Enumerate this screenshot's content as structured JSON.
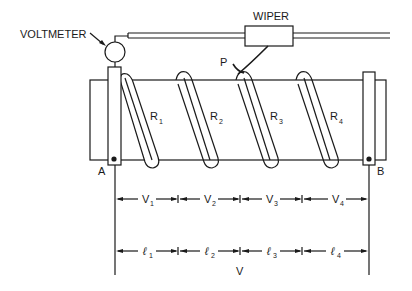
{
  "figure": {
    "type": "potentiometer slide-wire diagram",
    "labels": {
      "voltmeter": "VOLTMETER",
      "wiper": "WIPER",
      "contact_point": "P",
      "terminal_a": "A",
      "terminal_b": "B",
      "total_voltage": "V"
    },
    "resistors": [
      {
        "base": "R",
        "sub": "1"
      },
      {
        "base": "R",
        "sub": "2"
      },
      {
        "base": "R",
        "sub": "3"
      },
      {
        "base": "R",
        "sub": "4"
      }
    ],
    "voltages": [
      {
        "base": "V",
        "sub": "1"
      },
      {
        "base": "V",
        "sub": "2"
      },
      {
        "base": "V",
        "sub": "3"
      },
      {
        "base": "V",
        "sub": "4"
      }
    ],
    "lengths": [
      {
        "base": "ℓ",
        "sub": "1"
      },
      {
        "base": "ℓ",
        "sub": "2"
      },
      {
        "base": "ℓ",
        "sub": "3"
      },
      {
        "base": "ℓ",
        "sub": "4"
      }
    ],
    "colors": {
      "ink": "#1a1a1a",
      "background": "#ffffff"
    }
  }
}
